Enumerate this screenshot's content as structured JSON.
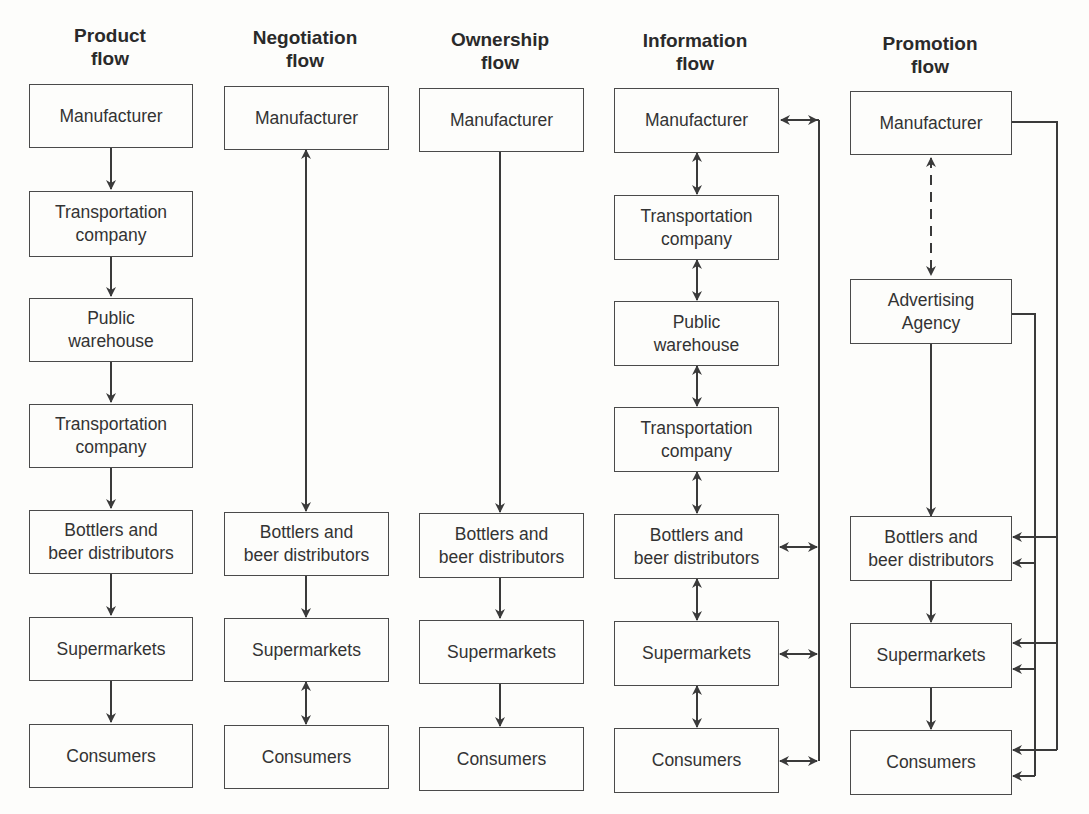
{
  "diagram": {
    "columns": [
      {
        "id": "product",
        "title": [
          "Product",
          "flow"
        ],
        "nodes": [
          [
            "Manufacturer"
          ],
          [
            "Transportation",
            "company"
          ],
          [
            "Public",
            "warehouse"
          ],
          [
            "Transportation",
            "company"
          ],
          [
            "Bottlers and",
            "beer distributors"
          ],
          [
            "Supermarkets"
          ],
          [
            "Consumers"
          ]
        ],
        "connectors": "one-way downward arrows between consecutive nodes"
      },
      {
        "id": "negotiation",
        "title": [
          "Negotiation",
          "flow"
        ],
        "nodes": [
          [
            "Manufacturer"
          ],
          [
            "Bottlers and",
            "beer distributors"
          ],
          [
            "Supermarkets"
          ],
          [
            "Consumers"
          ]
        ],
        "connectors": "two-way Manufacturer<->Bottlers; down Bottlers->Supermarkets; two-way Supermarkets<->Consumers"
      },
      {
        "id": "ownership",
        "title": [
          "Ownership",
          "flow"
        ],
        "nodes": [
          [
            "Manufacturer"
          ],
          [
            "Bottlers and",
            "beer distributors"
          ],
          [
            "Supermarkets"
          ],
          [
            "Consumers"
          ]
        ],
        "connectors": "one-way downward arrows"
      },
      {
        "id": "information",
        "title": [
          "Information",
          "flow"
        ],
        "nodes": [
          [
            "Manufacturer"
          ],
          [
            "Transportation",
            "company"
          ],
          [
            "Public",
            "warehouse"
          ],
          [
            "Transportation",
            "company"
          ],
          [
            "Bottlers and",
            "beer distributors"
          ],
          [
            "Supermarkets"
          ],
          [
            "Consumers"
          ]
        ],
        "connectors": "two-way arrows between consecutive nodes; side bus with two-way arrows to Manufacturer, Bottlers, Supermarkets, Consumers"
      },
      {
        "id": "promotion",
        "title": [
          "Promotion",
          "flow"
        ],
        "nodes": [
          [
            "Manufacturer"
          ],
          [
            "Advertising",
            "Agency"
          ],
          [
            "Bottlers and",
            "beer distributors"
          ],
          [
            "Supermarkets"
          ],
          [
            "Consumers"
          ]
        ],
        "connectors": "dashed two-way Manufacturer<->Advertising Agency; down Agency->Bottlers->Supermarkets->Consumers; Manufacturer bus and Agency bus feeding arrows into Bottlers, Supermarkets, Consumers"
      }
    ],
    "colors": {
      "line": "#3a3a3a",
      "box_border": "#4a4a4a",
      "text": "#2a2a2a",
      "background": "#fdfdfb"
    }
  }
}
